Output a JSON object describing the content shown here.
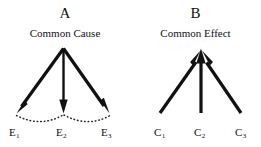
{
  "figure": {
    "background_color": "#ffffff",
    "ink_color": "#111111",
    "panels": [
      {
        "id": "A",
        "letter": "A",
        "caption": "Common Cause",
        "structure": "one apex node with three arrows pointing outward and downward to three effect nodes; dotted arcs connect the arrow tips",
        "arrow_direction": "downward",
        "nodes": [
          {
            "id": "E1",
            "base": "E",
            "sub": "1"
          },
          {
            "id": "E2",
            "base": "E",
            "sub": "2"
          },
          {
            "id": "E3",
            "base": "E",
            "sub": "3"
          }
        ]
      },
      {
        "id": "B",
        "letter": "B",
        "caption": "Common Effect",
        "structure": "three arrows from three cause nodes converging upward into a single apex node",
        "arrow_direction": "upward",
        "nodes": [
          {
            "id": "C1",
            "base": "C",
            "sub": "1"
          },
          {
            "id": "C2",
            "base": "C",
            "sub": "2"
          },
          {
            "id": "C3",
            "base": "C",
            "sub": "3"
          }
        ]
      }
    ]
  }
}
